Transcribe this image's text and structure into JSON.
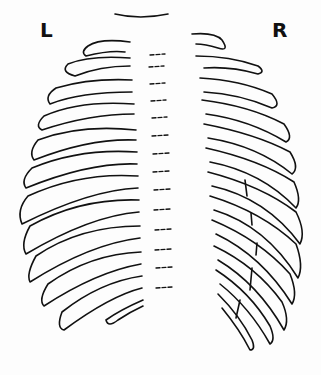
{
  "diagram": {
    "labels": {
      "left": "L",
      "right": "R"
    },
    "fracture_marks_side": "R",
    "fracture_marks_count": 5,
    "rib_pairs_count": 12,
    "colors": {
      "stroke": "#111111",
      "background": "#fdfdfd"
    }
  }
}
